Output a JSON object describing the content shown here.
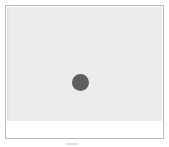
{
  "frame": {
    "image": {
      "background_color": "#ececec",
      "marker": {
        "shape": "circle",
        "color": "#5e5e5e"
      }
    },
    "caption_strip": {
      "background_color": "#ffffff"
    },
    "border_color": "#b9b9b9"
  }
}
